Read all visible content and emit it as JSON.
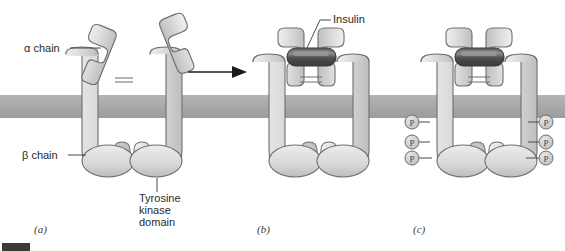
{
  "figure": {
    "background_color": "#ffffff",
    "width": 565,
    "height": 251
  },
  "colors": {
    "membrane": "#a9a9a9",
    "membrane_edge": "#9a9a9a",
    "protein_fill_light": "#e3e3e3",
    "protein_fill_mid": "#c9c9c9",
    "protein_outline": "#6e6e6e",
    "insulin_dark": "#4a4a4a",
    "insulin_highlight": "#9b9b9b",
    "text": "#2b2b2b",
    "leader_line": "#4a4a4a",
    "arrow": "#1c1c1c",
    "corner_mark": "#3a3a3a"
  },
  "labels": {
    "alpha_chain": "α chain",
    "beta_chain": "β chain",
    "tyrosine_kinase_line1": "Tyrosine",
    "tyrosine_kinase_line2": "kinase",
    "tyrosine_kinase_line3": "domain",
    "insulin": "Insulin",
    "phosphate": "P"
  },
  "panels": [
    {
      "id": "a",
      "caption": "(a)",
      "state": "unbound receptor with splayed alpha chains",
      "phosphorylated": false,
      "insulin_bound": false
    },
    {
      "id": "b",
      "caption": "(b)",
      "state": "insulin bound, alpha chains closed",
      "phosphorylated": false,
      "insulin_bound": true
    },
    {
      "id": "c",
      "caption": "(c)",
      "state": "autophosphorylated tyrosine kinase domains",
      "phosphorylated": true,
      "insulin_bound": true
    }
  ],
  "phosphates": {
    "count_per_side": 3,
    "sides": [
      "left",
      "right"
    ],
    "symbol": "P"
  },
  "arrow": {
    "direction": "right",
    "from_panel": "a",
    "to_panel": "b"
  }
}
